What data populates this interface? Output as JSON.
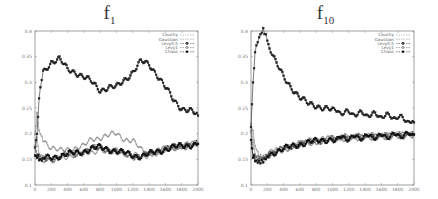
{
  "chart_data": [
    {
      "type": "line",
      "title": "f1",
      "title_base": "f",
      "title_sub": "1",
      "xlabel": "",
      "ylabel": "",
      "xlim": [
        0,
        2000
      ],
      "ylim": [
        0.1,
        0.4
      ],
      "xticks": [
        0,
        200,
        400,
        600,
        800,
        1000,
        1200,
        1400,
        1600,
        1800,
        2000
      ],
      "yticks": [
        "0.1",
        "0.15",
        "0.2",
        "0.25",
        "0.3",
        "0.35",
        "0.4"
      ],
      "grid": false,
      "legend_position": "top-right",
      "x": [
        0,
        25,
        50,
        100,
        200,
        300,
        400,
        500,
        600,
        700,
        800,
        900,
        1000,
        1100,
        1200,
        1300,
        1400,
        1500,
        1600,
        1700,
        1800,
        1900,
        2000
      ],
      "series": [
        {
          "name": "Cauchy",
          "marker": "+",
          "values": [
            0.17,
            0.19,
            0.16,
            0.15,
            0.15,
            0.153,
            0.157,
            0.158,
            0.162,
            0.165,
            0.17,
            0.168,
            0.166,
            0.162,
            0.158,
            0.155,
            0.16,
            0.165,
            0.17,
            0.173,
            0.176,
            0.178,
            0.18
          ]
        },
        {
          "name": "Gaussian",
          "marker": "x",
          "values": [
            0.2,
            0.235,
            0.21,
            0.19,
            0.172,
            0.166,
            0.17,
            0.172,
            0.175,
            0.19,
            0.193,
            0.196,
            0.2,
            0.19,
            0.186,
            0.168,
            0.162,
            0.165,
            0.17,
            0.173,
            0.176,
            0.178,
            0.18
          ]
        },
        {
          "name": "Levy0.5",
          "marker": "*",
          "values": [
            0.17,
            0.2,
            0.27,
            0.32,
            0.34,
            0.345,
            0.325,
            0.32,
            0.31,
            0.3,
            0.285,
            0.29,
            0.29,
            0.305,
            0.32,
            0.34,
            0.335,
            0.315,
            0.29,
            0.265,
            0.25,
            0.245,
            0.235
          ]
        },
        {
          "name": "Levy1",
          "marker": "square",
          "values": [
            0.17,
            0.16,
            0.152,
            0.15,
            0.15,
            0.155,
            0.158,
            0.16,
            0.165,
            0.17,
            0.172,
            0.168,
            0.165,
            0.16,
            0.157,
            0.155,
            0.16,
            0.165,
            0.17,
            0.173,
            0.176,
            0.178,
            0.18
          ]
        },
        {
          "name": "Chaos",
          "marker": "filled-square",
          "values": [
            0.16,
            0.155,
            0.15,
            0.152,
            0.153,
            0.157,
            0.16,
            0.162,
            0.166,
            0.171,
            0.173,
            0.17,
            0.166,
            0.162,
            0.158,
            0.156,
            0.16,
            0.165,
            0.17,
            0.173,
            0.176,
            0.178,
            0.18
          ]
        }
      ]
    },
    {
      "type": "line",
      "title": "f10",
      "title_base": "f",
      "title_sub": "10",
      "xlabel": "",
      "ylabel": "",
      "xlim": [
        0,
        2000
      ],
      "ylim": [
        0.1,
        0.4
      ],
      "xticks": [
        0,
        200,
        400,
        600,
        800,
        1000,
        1200,
        1400,
        1600,
        1800,
        2000
      ],
      "yticks": [
        "0.1",
        "0.15",
        "0.2",
        "0.25",
        "0.3",
        "0.35",
        "0.4"
      ],
      "grid": false,
      "legend_position": "top-right",
      "x": [
        0,
        25,
        50,
        100,
        150,
        200,
        300,
        400,
        500,
        600,
        700,
        800,
        900,
        1000,
        1200,
        1400,
        1600,
        1800,
        2000
      ],
      "series": [
        {
          "name": "Cauchy",
          "marker": "+",
          "values": [
            0.22,
            0.18,
            0.16,
            0.155,
            0.155,
            0.16,
            0.165,
            0.17,
            0.175,
            0.18,
            0.183,
            0.185,
            0.188,
            0.19,
            0.192,
            0.194,
            0.195,
            0.197,
            0.198
          ]
        },
        {
          "name": "Gaussian",
          "marker": "x",
          "values": [
            0.22,
            0.2,
            0.18,
            0.16,
            0.157,
            0.16,
            0.165,
            0.17,
            0.175,
            0.18,
            0.183,
            0.185,
            0.188,
            0.19,
            0.192,
            0.194,
            0.195,
            0.197,
            0.198
          ]
        },
        {
          "name": "Levy0.5",
          "marker": "*",
          "values": [
            0.21,
            0.3,
            0.36,
            0.385,
            0.4,
            0.38,
            0.34,
            0.31,
            0.29,
            0.27,
            0.258,
            0.255,
            0.25,
            0.245,
            0.24,
            0.238,
            0.235,
            0.232,
            0.222
          ]
        },
        {
          "name": "Levy1",
          "marker": "square",
          "values": [
            0.2,
            0.16,
            0.15,
            0.148,
            0.15,
            0.158,
            0.165,
            0.17,
            0.175,
            0.18,
            0.183,
            0.185,
            0.188,
            0.19,
            0.192,
            0.194,
            0.195,
            0.197,
            0.198
          ]
        },
        {
          "name": "Chaos",
          "marker": "filled-square",
          "values": [
            0.19,
            0.155,
            0.148,
            0.147,
            0.15,
            0.158,
            0.165,
            0.17,
            0.175,
            0.18,
            0.183,
            0.185,
            0.188,
            0.19,
            0.192,
            0.194,
            0.195,
            0.197,
            0.198
          ]
        }
      ]
    }
  ]
}
